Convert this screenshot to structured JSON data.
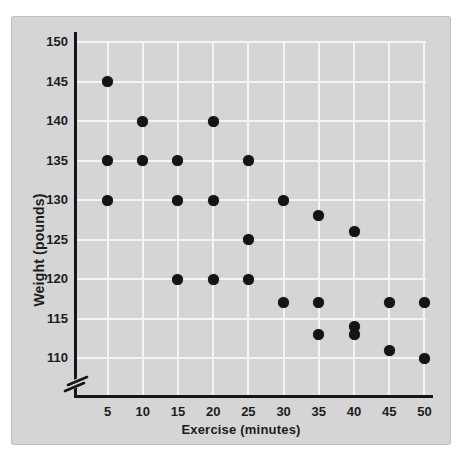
{
  "chart_data": {
    "type": "scatter",
    "title": "",
    "xlabel": "Exercise (minutes)",
    "ylabel": "Weight (pounds)",
    "x_ticks": [
      5,
      10,
      15,
      20,
      25,
      30,
      35,
      40,
      45,
      50
    ],
    "y_ticks": [
      150,
      145,
      140,
      135,
      130,
      125,
      120,
      115,
      110
    ],
    "xlim": [
      0,
      50
    ],
    "ylim": [
      110,
      150
    ],
    "y_axis_break": true,
    "grid": true,
    "legend": "none",
    "points": [
      [
        5,
        145
      ],
      [
        5,
        135
      ],
      [
        5,
        130
      ],
      [
        10,
        140
      ],
      [
        10,
        135
      ],
      [
        15,
        135
      ],
      [
        15,
        130
      ],
      [
        15,
        120
      ],
      [
        20,
        140
      ],
      [
        20,
        130
      ],
      [
        20,
        120
      ],
      [
        25,
        135
      ],
      [
        25,
        125
      ],
      [
        25,
        120
      ],
      [
        30,
        130
      ],
      [
        30,
        117
      ],
      [
        35,
        128
      ],
      [
        35,
        117
      ],
      [
        35,
        113
      ],
      [
        40,
        126
      ],
      [
        40,
        114
      ],
      [
        40,
        113
      ],
      [
        45,
        117
      ],
      [
        45,
        111
      ],
      [
        50,
        117
      ],
      [
        50,
        110
      ]
    ]
  },
  "colors": {
    "panel": "#d5d5d5",
    "grid_line": "#f4f4f4",
    "axis": "#161616",
    "dot": "#141414",
    "text": "#1c1c1c",
    "background": "#ffffff"
  }
}
